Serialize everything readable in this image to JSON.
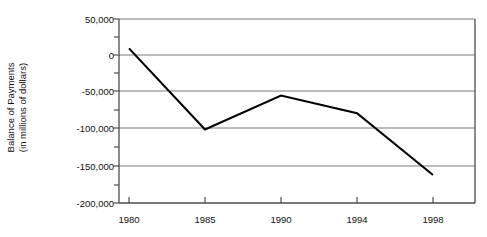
{
  "chart_data": {
    "type": "line",
    "title": "",
    "subtitle": "",
    "xlabel": "",
    "ylabel": "Balance of Payments (in millions of dollars)",
    "ylabel_line1": "Balance of Payments",
    "ylabel_line2": "(in millions of dollars)",
    "categories": [
      "1980",
      "1985",
      "1990",
      "1994",
      "1998"
    ],
    "x": [
      1980,
      1985,
      1990,
      1994,
      1998
    ],
    "values": [
      10000,
      -100000,
      -54000,
      -78000,
      -162000
    ],
    "series": [
      {
        "name": "Balance of Payments",
        "values": [
          10000,
          -100000,
          -54000,
          -78000,
          -162000
        ],
        "color": "#000000"
      }
    ],
    "ylim": [
      -200000,
      50000
    ],
    "ytick_values": [
      50000,
      0,
      -50000,
      -100000,
      -150000,
      -200000
    ],
    "ytick_labels": [
      "50,000",
      "0",
      "-50,000",
      "-100,000",
      "-150,000",
      "-200,000"
    ],
    "yminor_tick_values": [
      25000,
      -25000,
      -75000,
      -125000,
      -175000
    ],
    "xtick_labels": [
      "1980",
      "1985",
      "1990",
      "1994",
      "1998"
    ],
    "grid": "horizontal",
    "legend": "none",
    "plot_border": true,
    "colors": {
      "line": "#1a1a1a",
      "gridline": "#7a7a7a",
      "axis": "#4d4d4d",
      "text": "#111111",
      "background": "#ffffff"
    }
  }
}
